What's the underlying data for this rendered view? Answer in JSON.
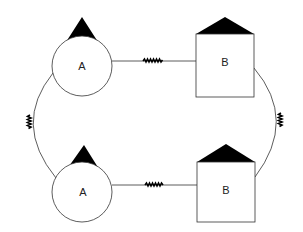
{
  "diagram": {
    "colors": {
      "background": "#ffffff",
      "stroke": "#333333",
      "fill_dark": "#000000"
    },
    "nodes": [
      {
        "id": "a_top",
        "shape": "circle",
        "label": "A",
        "cx": 82,
        "cy": 66,
        "r": 30,
        "cap": "triangle"
      },
      {
        "id": "b_top",
        "shape": "square",
        "label": "B",
        "x": 196,
        "y": 34,
        "w": 58,
        "h": 63,
        "cap": "triangle"
      },
      {
        "id": "a_bottom",
        "shape": "circle",
        "label": "A",
        "cx": 82,
        "cy": 192,
        "r": 30,
        "cap": "triangle"
      },
      {
        "id": "b_bottom",
        "shape": "square",
        "label": "B",
        "x": 197,
        "y": 162,
        "w": 58,
        "h": 60,
        "cap": "triangle"
      }
    ],
    "edges": [
      {
        "id": "top",
        "from": "a_top",
        "to": "b_top",
        "style": "straight",
        "marker": "squiggle"
      },
      {
        "id": "bottom",
        "from": "a_bottom",
        "to": "b_bottom",
        "style": "straight",
        "marker": "squiggle"
      },
      {
        "id": "left",
        "from": "a_top",
        "to": "a_bottom",
        "style": "arc",
        "marker": "squiggle"
      },
      {
        "id": "right",
        "from": "b_top",
        "to": "b_bottom",
        "style": "arc",
        "marker": "squiggle"
      }
    ],
    "labels": {
      "a_top": "A",
      "b_top": "B",
      "a_bottom": "A",
      "b_bottom": "B"
    }
  }
}
